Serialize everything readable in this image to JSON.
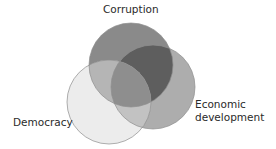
{
  "diagram": {
    "type": "venn",
    "sets": [
      {
        "name": "corruption",
        "label": "Corruption",
        "cx": 131,
        "cy": 65,
        "r": 42,
        "color": "#8a8a8a"
      },
      {
        "name": "economic",
        "label_line1": "Economic",
        "label_line2": "development",
        "cx": 153,
        "cy": 87,
        "r": 42,
        "color": "#adadad"
      },
      {
        "name": "democracy",
        "label": "Democracy",
        "cx": 109,
        "cy": 102,
        "r": 42,
        "color": "#ececec"
      }
    ],
    "overlap_colors": {
      "corruption_economic": "#5e5e5e",
      "corruption_democracy": "#b5b5b5",
      "economic_democracy": "#c2c2c2",
      "all_three": "#8e8e8e"
    },
    "stroke_color": "#8c8c8c"
  },
  "labels": {
    "corruption": "Corruption",
    "economic_line1": "Economic",
    "economic_line2": "development",
    "democracy": "Democracy"
  }
}
